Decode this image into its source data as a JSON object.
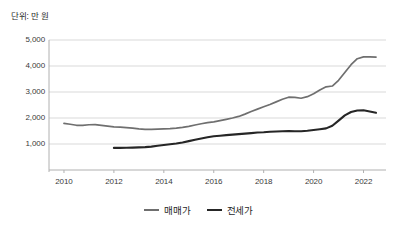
{
  "chart_data": {
    "type": "line",
    "title": "",
    "subtitle": "",
    "unit_label": "단위: 만 원",
    "xlabel": "",
    "ylabel": "",
    "xlim": [
      2009.4,
      2022.9
    ],
    "ylim": [
      0,
      5000
    ],
    "ytick_values": [
      1000,
      2000,
      3000,
      4000,
      5000
    ],
    "ytick_labels": [
      "1,000",
      "2,000",
      "3,000",
      "4,000",
      "5,000"
    ],
    "xtick_values": [
      2010,
      2012,
      2014,
      2016,
      2018,
      2020,
      2022
    ],
    "xtick_labels": [
      "2010",
      "2012",
      "2014",
      "2016",
      "2018",
      "2020",
      "2022"
    ],
    "grid": "horizontal",
    "legend_position": "bottom-center",
    "series": [
      {
        "name": "매매가",
        "color": "#6f6f6f",
        "x": [
          2010.0,
          2010.25,
          2010.5,
          2010.75,
          2011.0,
          2011.25,
          2011.5,
          2011.75,
          2012.0,
          2012.25,
          2012.5,
          2012.75,
          2013.0,
          2013.25,
          2013.5,
          2013.75,
          2014.0,
          2014.25,
          2014.5,
          2014.75,
          2015.0,
          2015.25,
          2015.5,
          2015.75,
          2016.0,
          2016.25,
          2016.5,
          2016.75,
          2017.0,
          2017.25,
          2017.5,
          2017.75,
          2018.0,
          2018.25,
          2018.5,
          2018.75,
          2019.0,
          2019.25,
          2019.5,
          2019.75,
          2020.0,
          2020.25,
          2020.5,
          2020.75,
          2021.0,
          2021.25,
          2021.5,
          2021.75,
          2022.0,
          2022.25,
          2022.5
        ],
        "values": [
          1790,
          1760,
          1720,
          1720,
          1740,
          1745,
          1720,
          1690,
          1660,
          1650,
          1630,
          1610,
          1580,
          1560,
          1560,
          1570,
          1580,
          1590,
          1610,
          1640,
          1680,
          1730,
          1780,
          1820,
          1850,
          1900,
          1950,
          2000,
          2060,
          2150,
          2250,
          2340,
          2430,
          2520,
          2620,
          2720,
          2800,
          2790,
          2760,
          2820,
          2930,
          3080,
          3200,
          3230,
          3450,
          3750,
          4050,
          4280,
          4350,
          4350,
          4340
        ]
      },
      {
        "name": "전세가",
        "color": "#262626",
        "x": [
          2012.0,
          2012.25,
          2012.5,
          2012.75,
          2013.0,
          2013.25,
          2013.5,
          2013.75,
          2014.0,
          2014.25,
          2014.5,
          2014.75,
          2015.0,
          2015.25,
          2015.5,
          2015.75,
          2016.0,
          2016.25,
          2016.5,
          2016.75,
          2017.0,
          2017.25,
          2017.5,
          2017.75,
          2018.0,
          2018.25,
          2018.5,
          2018.75,
          2019.0,
          2019.25,
          2019.5,
          2019.75,
          2020.0,
          2020.25,
          2020.5,
          2020.75,
          2021.0,
          2021.25,
          2021.5,
          2021.75,
          2022.0,
          2022.25,
          2022.5
        ],
        "values": [
          850,
          850,
          855,
          860,
          870,
          880,
          900,
          930,
          960,
          990,
          1020,
          1060,
          1110,
          1160,
          1210,
          1260,
          1300,
          1320,
          1340,
          1360,
          1380,
          1400,
          1420,
          1440,
          1450,
          1470,
          1480,
          1490,
          1500,
          1490,
          1490,
          1510,
          1540,
          1570,
          1600,
          1700,
          1900,
          2100,
          2230,
          2290,
          2300,
          2250,
          2200
        ]
      }
    ]
  },
  "legend": {
    "items": [
      {
        "label": "매매가",
        "color": "#6f6f6f"
      },
      {
        "label": "전세가",
        "color": "#262626"
      }
    ]
  },
  "axis_colors": {
    "grid": "#d9d9d9",
    "axis": "#b0b0b0",
    "tick_text": "#3a3a3a"
  }
}
